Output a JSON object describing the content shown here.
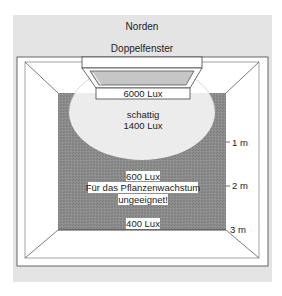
{
  "diagram": {
    "direction_label": "Norden",
    "window_label": "Doppelfenster",
    "zones": [
      {
        "label": "6000 Lux"
      },
      {
        "label_line1": "schattig",
        "label_line2": "1400 Lux"
      },
      {
        "label_line1": "600 Lux",
        "label_line2": "Für das Pflanzenwachstum",
        "label_line3": "ungeeignet!"
      },
      {
        "label": "400 Lux"
      }
    ],
    "distance_marks": [
      "1 m",
      "2 m",
      "3 m"
    ],
    "colors": {
      "panel_background": "#e4e4e4",
      "room_wall": "#ffffff",
      "floor_dark": "#8a8a8a",
      "bright_zone": "#eeeeee",
      "window_glass": "#c8c8c8",
      "lines": "#333333"
    }
  }
}
